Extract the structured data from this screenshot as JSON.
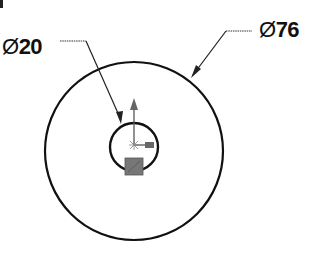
{
  "drawing": {
    "type": "circular drawing with diameter dimensions",
    "dimensions": [
      {
        "id": "inner",
        "symbol": "Ø",
        "value": "20"
      },
      {
        "id": "outer",
        "symbol": "Ø",
        "value": "76"
      }
    ],
    "colors": {
      "line": "#111111",
      "triad": "#555555",
      "origin_box": "#777777"
    }
  }
}
